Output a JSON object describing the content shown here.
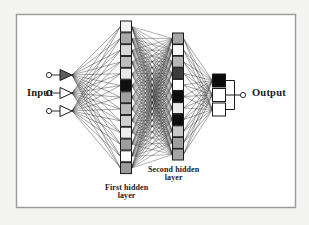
{
  "figure": {
    "kind": "neural-network-diagram",
    "background_color": "#f3f3f1",
    "panel_color": "#ffffff",
    "frame_color": "#9a9a9a",
    "frame": {
      "x": 16,
      "y": 14,
      "width": 280,
      "height": 194
    },
    "line_color": "#2b2b2b",
    "node_stroke_color": "#1a1a1a"
  },
  "labels": {
    "input": "Input",
    "output": "Output",
    "first_hidden_line1": "First hidden",
    "first_hidden_line2": "layer",
    "second_hidden_line1": "Second hidden",
    "second_hidden_line2": "layer"
  },
  "chart_data": {
    "type": "diagram",
    "title": "",
    "layers": [
      {
        "name": "input",
        "label": "Input",
        "node_shape": "circle-and-triangle",
        "count": 3,
        "cx": 66,
        "circle_r": 2.6,
        "triangle_width": 12,
        "triangle_height": 11,
        "ys": [
          75,
          93,
          111
        ],
        "fills": [
          "#ffffff",
          "#ffffff",
          "#ffffff"
        ],
        "triangle_fills": [
          "#5e5e5e",
          "#ffffff",
          "#ffffff"
        ]
      },
      {
        "name": "first_hidden",
        "label": "First hidden layer",
        "node_shape": "square",
        "count": 13,
        "cx": 126,
        "size": 11,
        "top": 21,
        "pitch": 11.8,
        "fills": [
          "#f2f2f2",
          "#a8a8a8",
          "#d8d8d8",
          "#bdbdbd",
          "#e8e8e8",
          "#101010",
          "#a0a0a0",
          "#b8b8b8",
          "#cfcfcf",
          "#ededed",
          "#9e9e9e",
          "#fbfbfb",
          "#9a9a9a"
        ]
      },
      {
        "name": "second_hidden",
        "label": "Second hidden layer",
        "node_shape": "square",
        "count": 11,
        "cx": 178,
        "size": 11,
        "top": 33,
        "pitch": 11.6,
        "fills": [
          "#a6a6a6",
          "#fafafa",
          "#b6b6b6",
          "#3c3c3c",
          "#ffffff",
          "#0c0c0c",
          "#e9e9e9",
          "#0c0c0c",
          "#c6c6c6",
          "#9e9e9e",
          "#a4a4a4"
        ]
      },
      {
        "name": "output",
        "label": "Output",
        "node_shape": "square",
        "count": 3,
        "cx": 219,
        "size": 13,
        "top": 74,
        "pitch": 14.5,
        "fills": [
          "#0a0a0a",
          "#ffffff",
          "#ffffff"
        ],
        "terminal_circle": {
          "cx": 243,
          "cy": 95,
          "r": 2.6,
          "fill": "#ffffff"
        }
      }
    ],
    "connections": [
      {
        "from": "input",
        "to": "first_hidden",
        "style": "fully-connected"
      },
      {
        "from": "first_hidden",
        "to": "second_hidden",
        "style": "fully-connected"
      },
      {
        "from": "second_hidden",
        "to": "output",
        "style": "fully-connected"
      }
    ],
    "legend": [],
    "annotations": [
      {
        "text": "Input",
        "x": 27,
        "y": 93
      },
      {
        "text": "Output",
        "x": 252,
        "y": 93
      },
      {
        "text": "First hidden layer",
        "x": 135,
        "y": 190
      },
      {
        "text": "Second hidden layer",
        "x": 183,
        "y": 172
      }
    ]
  }
}
